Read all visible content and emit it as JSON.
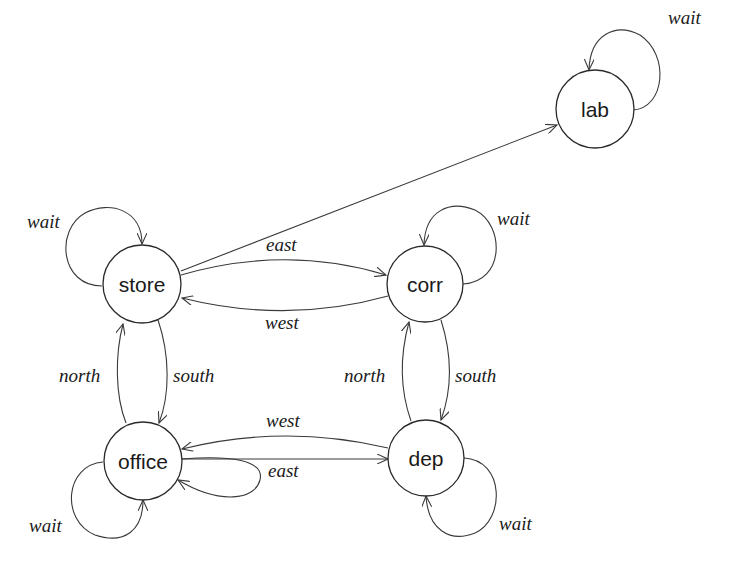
{
  "diagram": {
    "type": "state-transition-graph",
    "nodes": [
      {
        "id": "lab",
        "label": "lab",
        "cx": 595,
        "cy": 109,
        "r": 39
      },
      {
        "id": "store",
        "label": "store",
        "cx": 142,
        "cy": 284,
        "r": 39
      },
      {
        "id": "corr",
        "label": "corr",
        "cx": 425,
        "cy": 284,
        "r": 38
      },
      {
        "id": "office",
        "label": "office",
        "cx": 143,
        "cy": 461,
        "r": 39
      },
      {
        "id": "dep",
        "label": "dep",
        "cx": 426,
        "cy": 458,
        "r": 38
      }
    ],
    "edges": [
      {
        "from": "lab",
        "to": "lab",
        "label": "wait"
      },
      {
        "from": "store",
        "to": "lab",
        "label": ""
      },
      {
        "from": "store",
        "to": "store",
        "label": "wait"
      },
      {
        "from": "store",
        "to": "corr",
        "label": "east"
      },
      {
        "from": "corr",
        "to": "store",
        "label": "west"
      },
      {
        "from": "corr",
        "to": "corr",
        "label": "wait"
      },
      {
        "from": "store",
        "to": "office",
        "label": "south"
      },
      {
        "from": "office",
        "to": "store",
        "label": "north"
      },
      {
        "from": "corr",
        "to": "dep",
        "label": "south"
      },
      {
        "from": "dep",
        "to": "corr",
        "label": "north"
      },
      {
        "from": "office",
        "to": "dep",
        "label": ""
      },
      {
        "from": "dep",
        "to": "office",
        "label": "west"
      },
      {
        "from": "office",
        "to": "office",
        "label": "east"
      },
      {
        "from": "office",
        "to": "office",
        "label": "wait"
      },
      {
        "from": "dep",
        "to": "dep",
        "label": "wait"
      }
    ]
  },
  "labels": {
    "lab_wait": "wait",
    "store_wait": "wait",
    "store_east": "east",
    "corr_west": "west",
    "corr_wait": "wait",
    "store_south": "south",
    "office_north": "north",
    "corr_south": "south",
    "dep_north": "north",
    "dep_west": "west",
    "office_east": "east",
    "office_wait": "wait",
    "dep_wait": "wait"
  },
  "node_labels": {
    "lab": "lab",
    "store": "store",
    "corr": "corr",
    "office": "office",
    "dep": "dep"
  },
  "colors": {
    "background": "#ffffff",
    "stroke": "#2a2a2a",
    "text": "#1a1a1a"
  }
}
